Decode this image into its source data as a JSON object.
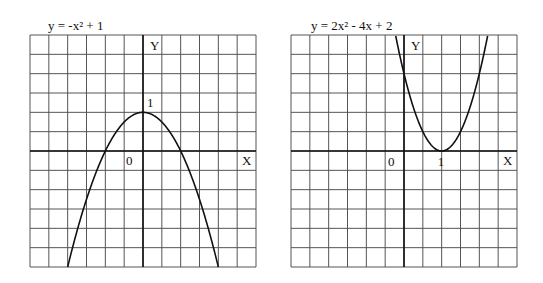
{
  "chart_data": [
    {
      "type": "line",
      "title": "y = -x² + 1",
      "equation": {
        "a": -1,
        "b": 0,
        "c": 1
      },
      "xlabel": "X",
      "ylabel": "Y",
      "grid": true,
      "units_per_cell": 0.5,
      "xlim": [
        -3,
        3
      ],
      "ylim": [
        -3,
        3
      ],
      "annotations": [
        "0",
        "1"
      ],
      "points": [
        [
          -2,
          -3
        ],
        [
          -1,
          0
        ],
        [
          0,
          1
        ],
        [
          1,
          0
        ],
        [
          2,
          -3
        ]
      ],
      "vertex": [
        0,
        1
      ],
      "x_intercepts": [
        -1,
        1
      ]
    },
    {
      "type": "line",
      "title": "y = 2x² - 4x + 2",
      "equation": {
        "a": 2,
        "b": -4,
        "c": 2
      },
      "xlabel": "X",
      "ylabel": "Y",
      "grid": true,
      "units_per_cell": 0.5,
      "xlim": [
        -3,
        3
      ],
      "ylim": [
        -3,
        3
      ],
      "annotations": [
        "0",
        "1"
      ],
      "points": [
        [
          -0.22,
          3
        ],
        [
          0,
          2
        ],
        [
          0.5,
          0.5
        ],
        [
          1,
          0
        ],
        [
          1.5,
          0.5
        ],
        [
          2,
          2
        ],
        [
          2.22,
          3
        ]
      ],
      "vertex": [
        1,
        0
      ],
      "y_intercept": 2
    }
  ],
  "panels": {
    "left": {
      "title": "y = -x² + 1",
      "x_label": "X",
      "y_label": "Y",
      "origin_label": "0",
      "tick_label": "1"
    },
    "right": {
      "title": "y = 2x² - 4x + 2",
      "x_label": "X",
      "y_label": "Y",
      "origin_label": "0",
      "tick_label": "1"
    }
  }
}
